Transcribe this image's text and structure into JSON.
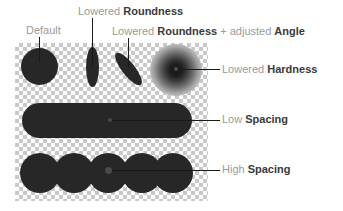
{
  "diagram": {
    "title_text": "Brush dynamics illustration",
    "canvas": {
      "background": "transparency-checkerboard",
      "checker_light": "#ffffff",
      "checker_dark": "#c9c9c9",
      "checker_cell_px": 4
    },
    "ink_color": "#272727",
    "label_color": "#7d7d7d",
    "label_emphasis_color": "#3a3a3a",
    "leader_color": "#1a1a1a",
    "callouts": {
      "default": {
        "prefix": "Default",
        "emphasis": "",
        "suffix": ""
      },
      "roundness": {
        "prefix": "Lowered ",
        "emphasis": "Roundness",
        "suffix": ""
      },
      "angle": {
        "prefix": "Lowered ",
        "emphasis": "Roundness",
        "middle": " + adjusted ",
        "emphasis2": "Angle"
      },
      "hardness": {
        "prefix": "Lowered ",
        "emphasis": "Hardness",
        "suffix": ""
      },
      "low_spacing": {
        "prefix": "Low ",
        "emphasis": "Spacing",
        "suffix": ""
      },
      "high_spacing": {
        "prefix": "High ",
        "emphasis": "Spacing",
        "suffix": ""
      }
    },
    "marks": {
      "default": {
        "shape": "circle",
        "label": "hard round dab"
      },
      "roundness": {
        "shape": "ellipse-vertical",
        "label": "narrow vertical dab"
      },
      "angle": {
        "shape": "ellipse-rotated",
        "label": "narrow rotated dab",
        "angle_deg": "-38"
      },
      "hardness": {
        "shape": "soft-radial-blob",
        "label": "soft-edged dab"
      },
      "low_spacing": {
        "shape": "capsule",
        "label": "continuous stroke"
      },
      "high_spacing": {
        "shape": "circle-row",
        "label": "spaced dab stroke",
        "dab_count": "5"
      }
    }
  }
}
